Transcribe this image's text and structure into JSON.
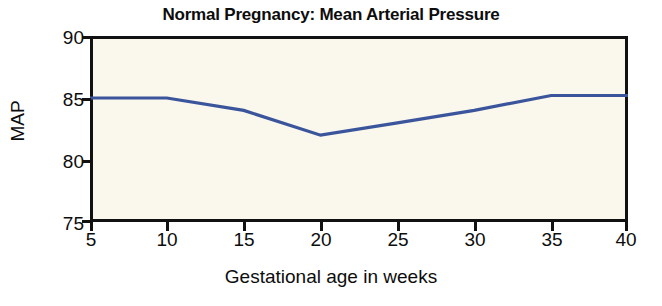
{
  "chart_data": {
    "type": "line",
    "title": "Normal Pregnancy: Mean Arterial Pressure",
    "xlabel": "Gestational age in weeks",
    "ylabel": "MAP",
    "x": [
      5,
      10,
      15,
      20,
      25,
      30,
      35,
      40
    ],
    "values": [
      85,
      85,
      84,
      82,
      83,
      84,
      85.2,
      85.2
    ],
    "series": [
      {
        "name": "Mean Arterial Pressure",
        "values": [
          85,
          85,
          84,
          82,
          83,
          84,
          85.2,
          85.2
        ]
      }
    ],
    "xlim": [
      5,
      40
    ],
    "ylim": [
      75,
      90
    ],
    "xticks": [
      "5",
      "10",
      "15",
      "20",
      "25",
      "30",
      "35",
      "40"
    ],
    "yticks": [
      "90",
      "85",
      "80",
      "75"
    ],
    "grid": false,
    "legend": false,
    "line_color": "#3a559c",
    "plot_background": "#faf7ed",
    "axis_color": "#111111"
  }
}
